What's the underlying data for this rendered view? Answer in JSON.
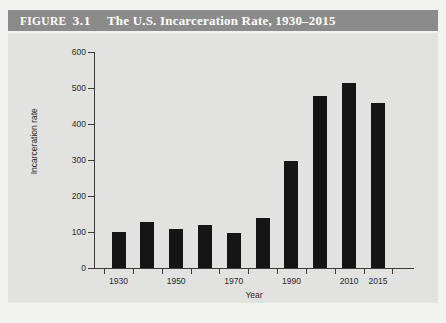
{
  "figure": {
    "label": "Figure",
    "number": "3.1",
    "title": "The U.S. Incarceration Rate, 1930–2015"
  },
  "colors": {
    "title_bar": "#8b8b8b",
    "title_text": "#ffffff",
    "panel_background": "#e2e2e0",
    "page_background": "#f2f2f0",
    "bar": "#151515",
    "axis": "#3a3a3a"
  },
  "chart_data": {
    "type": "bar",
    "title": "The U.S. Incarceration Rate, 1930–2015",
    "xlabel": "Year",
    "ylabel": "Incarceration rate",
    "categories": [
      "1930",
      "1940",
      "1950",
      "1960",
      "1970",
      "1980",
      "1990",
      "2000",
      "2010",
      "2015"
    ],
    "values": [
      100,
      128,
      109,
      119,
      96,
      139,
      297,
      478,
      513,
      458
    ],
    "x_tick_labels": [
      "1930",
      "1950",
      "1970",
      "1990",
      "2010",
      "2015"
    ],
    "x_tick_categories": [
      "1930",
      "1950",
      "1970",
      "1990",
      "2010",
      "2015"
    ],
    "y_tick_labels": [
      "0",
      "100",
      "200",
      "300",
      "400",
      "500",
      "600"
    ],
    "ylim": [
      0,
      600
    ],
    "ystep": 100,
    "grid": false,
    "legend": null
  }
}
